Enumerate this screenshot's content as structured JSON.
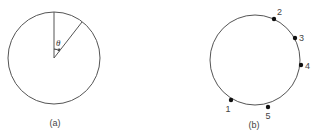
{
  "figure_a": {
    "caption": "(a)",
    "angle_label": "θ"
  },
  "figure_b": {
    "caption": "(b)",
    "points": [
      {
        "label": "1"
      },
      {
        "label": "2"
      },
      {
        "label": "3"
      },
      {
        "label": "4"
      },
      {
        "label": "5"
      }
    ]
  },
  "colors": {
    "line": "#555555",
    "point": "#111111",
    "text": "#444444"
  }
}
